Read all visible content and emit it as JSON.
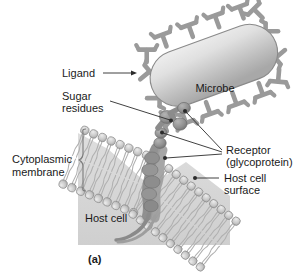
{
  "figure": {
    "caption": "(a)",
    "labels": {
      "ligand": "Ligand",
      "sugar_line1": "Sugar",
      "sugar_line2": "residues",
      "cytoplasmic_line1": "Cytoplasmic",
      "cytoplasmic_line2": "membrane",
      "microbe": "Microbe",
      "receptor_line1": "Receptor",
      "receptor_line2": "(glycoprotein)",
      "host_surface_line1": "Host cell",
      "host_surface_line2": "surface",
      "host_cell": "Host cell"
    },
    "colors": {
      "background": "#ffffff",
      "cytoplasm_fill": "#d9d9d9",
      "membrane_head": "#c9c9c9",
      "membrane_head_stroke": "#8f8f8f",
      "membrane_tail": "#b5b5b5",
      "microbe_body_light": "#e6e6e6",
      "microbe_body_dark": "#b0b0b0",
      "microbe_outline": "#8a8a8a",
      "ligand_gray": "#9a9a9a",
      "receptor_dark": "#8c8c8c",
      "text": "#1a1a1a",
      "leader_line": "#2b2b2b",
      "brace": "#7a7a7a"
    }
  }
}
